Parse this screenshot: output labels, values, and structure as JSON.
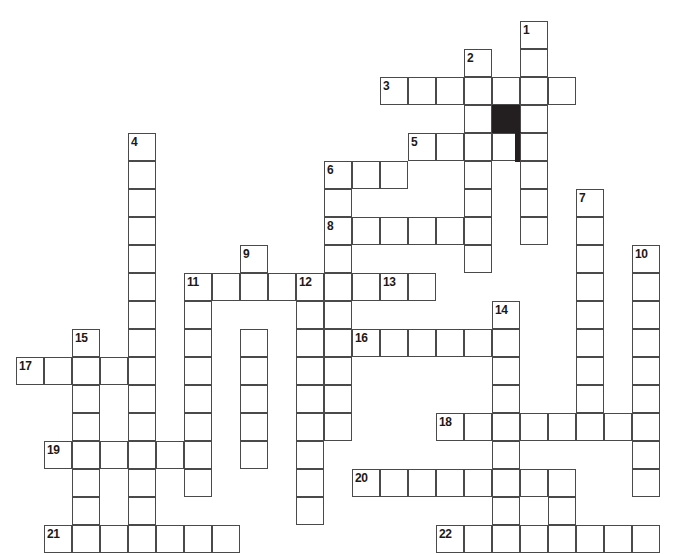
{
  "puzzle": {
    "type": "crossword-grid",
    "title": "",
    "cell_size": 28,
    "origin_x": 16,
    "origin_y": 21,
    "colors": {
      "cell_fill": "#ffffff",
      "cell_border": "#4a4a4a",
      "block_fill": "#231f20",
      "number_color": "#1a1a1a",
      "background": "#ffffff"
    },
    "entries": [
      {
        "number": "1",
        "direction": "down",
        "row": 0,
        "col": 18,
        "length": 4
      },
      {
        "number": "2",
        "direction": "down",
        "row": 1,
        "col": 16,
        "length": 5
      },
      {
        "number": "3",
        "direction": "across",
        "row": 2,
        "col": 13,
        "length": 7
      },
      {
        "number": "4",
        "direction": "down",
        "row": 4,
        "col": 4,
        "length": 12
      },
      {
        "number": "5",
        "direction": "across",
        "row": 4,
        "col": 14,
        "length": 5
      },
      {
        "number": "6",
        "direction": "across",
        "row": 5,
        "col": 11,
        "length": 3
      },
      {
        "number": "6",
        "direction": "down",
        "row": 5,
        "col": 11,
        "length": 9
      },
      {
        "number": "7",
        "direction": "down",
        "row": 6,
        "col": 20,
        "length": 11
      },
      {
        "number": "8",
        "direction": "across",
        "row": 7,
        "col": 11,
        "length": 5
      },
      {
        "number": "9",
        "direction": "down",
        "row": 8,
        "col": 8,
        "length": 8
      },
      {
        "number": "10",
        "direction": "down",
        "row": 8,
        "col": 22,
        "length": 11
      },
      {
        "number": "11",
        "direction": "across",
        "row": 9,
        "col": 6,
        "length": 9
      },
      {
        "number": "11",
        "direction": "down",
        "row": 9,
        "col": 6,
        "length": 8
      },
      {
        "number": "12",
        "direction": "down",
        "row": 9,
        "col": 10,
        "length": 9
      },
      {
        "number": "13",
        "direction": "across",
        "row": 9,
        "col": 13,
        "length": 3
      },
      {
        "number": "14",
        "direction": "down",
        "row": 10,
        "col": 17,
        "length": 6
      },
      {
        "number": "15",
        "direction": "down",
        "row": 11,
        "col": 2,
        "length": 7
      },
      {
        "number": "16",
        "direction": "across",
        "row": 11,
        "col": 12,
        "length": 5
      },
      {
        "number": "17",
        "direction": "across",
        "row": 12,
        "col": 0,
        "length": 5
      },
      {
        "number": "18",
        "direction": "across",
        "row": 14,
        "col": 15,
        "length": 8
      },
      {
        "number": "19",
        "direction": "across",
        "row": 15,
        "col": 1,
        "length": 5
      },
      {
        "number": "20",
        "direction": "across",
        "row": 16,
        "col": 12,
        "length": 8
      },
      {
        "number": "21",
        "direction": "across",
        "row": 18,
        "col": 1,
        "length": 7
      },
      {
        "number": "22",
        "direction": "across",
        "row": 18,
        "col": 15,
        "length": 8
      }
    ],
    "cells": [
      {
        "r": 0,
        "c": 18,
        "n": "1"
      },
      {
        "r": 1,
        "c": 16,
        "n": "2"
      },
      {
        "r": 1,
        "c": 18
      },
      {
        "r": 2,
        "c": 13,
        "n": "3"
      },
      {
        "r": 2,
        "c": 14
      },
      {
        "r": 2,
        "c": 15
      },
      {
        "r": 2,
        "c": 16
      },
      {
        "r": 2,
        "c": 17
      },
      {
        "r": 2,
        "c": 18
      },
      {
        "r": 2,
        "c": 19
      },
      {
        "r": 3,
        "c": 16
      },
      {
        "r": 3,
        "c": 17,
        "block": true
      },
      {
        "r": 3,
        "c": 18
      },
      {
        "r": 4,
        "c": 4,
        "n": "4"
      },
      {
        "r": 4,
        "c": 14,
        "n": "5"
      },
      {
        "r": 4,
        "c": 15
      },
      {
        "r": 4,
        "c": 16
      },
      {
        "r": 4,
        "c": 17,
        "bar": true
      },
      {
        "r": 4,
        "c": 18
      },
      {
        "r": 5,
        "c": 4
      },
      {
        "r": 5,
        "c": 11,
        "n": "6"
      },
      {
        "r": 5,
        "c": 12
      },
      {
        "r": 5,
        "c": 13
      },
      {
        "r": 5,
        "c": 16
      },
      {
        "r": 5,
        "c": 18
      },
      {
        "r": 6,
        "c": 4
      },
      {
        "r": 6,
        "c": 11
      },
      {
        "r": 6,
        "c": 16
      },
      {
        "r": 6,
        "c": 18
      },
      {
        "r": 6,
        "c": 20,
        "n": "7"
      },
      {
        "r": 7,
        "c": 4
      },
      {
        "r": 7,
        "c": 11,
        "n": "8"
      },
      {
        "r": 7,
        "c": 12
      },
      {
        "r": 7,
        "c": 13
      },
      {
        "r": 7,
        "c": 14
      },
      {
        "r": 7,
        "c": 15
      },
      {
        "r": 7,
        "c": 16
      },
      {
        "r": 7,
        "c": 18
      },
      {
        "r": 7,
        "c": 20
      },
      {
        "r": 8,
        "c": 4
      },
      {
        "r": 8,
        "c": 8,
        "n": "9"
      },
      {
        "r": 8,
        "c": 11
      },
      {
        "r": 8,
        "c": 16
      },
      {
        "r": 8,
        "c": 20
      },
      {
        "r": 8,
        "c": 22,
        "n": "10"
      },
      {
        "r": 9,
        "c": 4
      },
      {
        "r": 9,
        "c": 6,
        "n": "11"
      },
      {
        "r": 9,
        "c": 7
      },
      {
        "r": 9,
        "c": 8
      },
      {
        "r": 9,
        "c": 9
      },
      {
        "r": 9,
        "c": 10,
        "n": "12"
      },
      {
        "r": 9,
        "c": 11
      },
      {
        "r": 9,
        "c": 12
      },
      {
        "r": 9,
        "c": 13,
        "n": "13"
      },
      {
        "r": 9,
        "c": 14
      },
      {
        "r": 9,
        "c": 20
      },
      {
        "r": 9,
        "c": 22
      },
      {
        "r": 10,
        "c": 4
      },
      {
        "r": 10,
        "c": 6
      },
      {
        "r": 10,
        "c": 10
      },
      {
        "r": 10,
        "c": 11
      },
      {
        "r": 10,
        "c": 17,
        "n": "14"
      },
      {
        "r": 10,
        "c": 20
      },
      {
        "r": 10,
        "c": 22
      },
      {
        "r": 11,
        "c": 2,
        "n": "15"
      },
      {
        "r": 11,
        "c": 4
      },
      {
        "r": 11,
        "c": 6
      },
      {
        "r": 11,
        "c": 8
      },
      {
        "r": 11,
        "c": 10
      },
      {
        "r": 11,
        "c": 11
      },
      {
        "r": 11,
        "c": 12,
        "n": "16"
      },
      {
        "r": 11,
        "c": 13
      },
      {
        "r": 11,
        "c": 14
      },
      {
        "r": 11,
        "c": 15
      },
      {
        "r": 11,
        "c": 16
      },
      {
        "r": 11,
        "c": 17
      },
      {
        "r": 11,
        "c": 20
      },
      {
        "r": 11,
        "c": 22
      },
      {
        "r": 12,
        "c": 0,
        "n": "17"
      },
      {
        "r": 12,
        "c": 1
      },
      {
        "r": 12,
        "c": 2
      },
      {
        "r": 12,
        "c": 3
      },
      {
        "r": 12,
        "c": 4
      },
      {
        "r": 12,
        "c": 6
      },
      {
        "r": 12,
        "c": 8
      },
      {
        "r": 12,
        "c": 10
      },
      {
        "r": 12,
        "c": 11
      },
      {
        "r": 12,
        "c": 17
      },
      {
        "r": 12,
        "c": 20
      },
      {
        "r": 12,
        "c": 22
      },
      {
        "r": 13,
        "c": 2
      },
      {
        "r": 13,
        "c": 4
      },
      {
        "r": 13,
        "c": 6
      },
      {
        "r": 13,
        "c": 8
      },
      {
        "r": 13,
        "c": 10
      },
      {
        "r": 13,
        "c": 11
      },
      {
        "r": 13,
        "c": 17
      },
      {
        "r": 13,
        "c": 20
      },
      {
        "r": 13,
        "c": 22
      },
      {
        "r": 14,
        "c": 2
      },
      {
        "r": 14,
        "c": 4
      },
      {
        "r": 14,
        "c": 6
      },
      {
        "r": 14,
        "c": 8
      },
      {
        "r": 14,
        "c": 10
      },
      {
        "r": 14,
        "c": 11
      },
      {
        "r": 14,
        "c": 15,
        "n": "18"
      },
      {
        "r": 14,
        "c": 16
      },
      {
        "r": 14,
        "c": 17
      },
      {
        "r": 14,
        "c": 18
      },
      {
        "r": 14,
        "c": 19
      },
      {
        "r": 14,
        "c": 20
      },
      {
        "r": 14,
        "c": 21
      },
      {
        "r": 14,
        "c": 22
      },
      {
        "r": 15,
        "c": 1,
        "n": "19"
      },
      {
        "r": 15,
        "c": 2
      },
      {
        "r": 15,
        "c": 3
      },
      {
        "r": 15,
        "c": 4
      },
      {
        "r": 15,
        "c": 5
      },
      {
        "r": 15,
        "c": 6
      },
      {
        "r": 15,
        "c": 8
      },
      {
        "r": 15,
        "c": 10
      },
      {
        "r": 15,
        "c": 17
      },
      {
        "r": 15,
        "c": 22
      },
      {
        "r": 16,
        "c": 2
      },
      {
        "r": 16,
        "c": 4
      },
      {
        "r": 16,
        "c": 6
      },
      {
        "r": 16,
        "c": 10
      },
      {
        "r": 16,
        "c": 12,
        "n": "20"
      },
      {
        "r": 16,
        "c": 13
      },
      {
        "r": 16,
        "c": 14
      },
      {
        "r": 16,
        "c": 15
      },
      {
        "r": 16,
        "c": 16
      },
      {
        "r": 16,
        "c": 17
      },
      {
        "r": 16,
        "c": 18
      },
      {
        "r": 16,
        "c": 19
      },
      {
        "r": 16,
        "c": 22
      },
      {
        "r": 17,
        "c": 2
      },
      {
        "r": 17,
        "c": 4
      },
      {
        "r": 17,
        "c": 10
      },
      {
        "r": 17,
        "c": 17
      },
      {
        "r": 17,
        "c": 19
      },
      {
        "r": 18,
        "c": 1,
        "n": "21"
      },
      {
        "r": 18,
        "c": 2
      },
      {
        "r": 18,
        "c": 3
      },
      {
        "r": 18,
        "c": 4
      },
      {
        "r": 18,
        "c": 5
      },
      {
        "r": 18,
        "c": 6
      },
      {
        "r": 18,
        "c": 7
      },
      {
        "r": 18,
        "c": 15,
        "n": "22"
      },
      {
        "r": 18,
        "c": 16
      },
      {
        "r": 18,
        "c": 17
      },
      {
        "r": 18,
        "c": 18
      },
      {
        "r": 18,
        "c": 19
      },
      {
        "r": 18,
        "c": 20
      },
      {
        "r": 18,
        "c": 21
      },
      {
        "r": 18,
        "c": 22
      }
    ]
  }
}
